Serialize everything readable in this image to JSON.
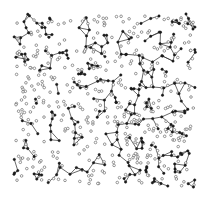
{
  "diagram": {
    "type": "network-graph",
    "region": {
      "x0": 14,
      "y0": 14,
      "x1": 196,
      "y1": 188
    },
    "colors": {
      "background": "#ffffff",
      "edge": "#2a2a2a",
      "filled_node": "#1a1a1a",
      "hollow_node_stroke": "#555555"
    },
    "filled_node_count": 260,
    "hollow_node_count": 420,
    "connect_radius": 13,
    "max_degree": 3,
    "seed": 7,
    "extra_segment": {
      "x1": 186,
      "y1": 14,
      "x2": 193,
      "y2": 29
    }
  }
}
